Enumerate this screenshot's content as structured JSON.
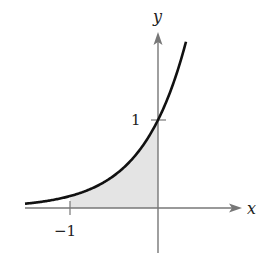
{
  "chart_data": {
    "type": "area",
    "title": "",
    "function": "y = e^(2x)",
    "xlabel": "x",
    "ylabel": "y",
    "x_ticks": [
      {
        "value": -1,
        "label": "−1"
      }
    ],
    "y_ticks": [
      {
        "value": 1,
        "label": "1"
      }
    ],
    "xlim": [
      -1.51,
      0.93
    ],
    "ylim": [
      -0.51,
      2.0
    ],
    "shaded_region": {
      "from_x": -1,
      "to_x": 0,
      "description": "area under curve between x=-1 and x=0"
    },
    "points": [
      {
        "x": -1.5,
        "y": 0.05
      },
      {
        "x": -1.0,
        "y": 0.135
      },
      {
        "x": -0.5,
        "y": 0.368
      },
      {
        "x": 0.0,
        "y": 1.0
      },
      {
        "x": 0.3,
        "y": 1.82
      }
    ],
    "grid": false,
    "colors": {
      "curve": "#111111",
      "axes": "#777777",
      "shade": "#e4e4e4"
    }
  },
  "labels": {
    "x_axis": "x",
    "y_axis": "y",
    "x_tick_neg1": "−1",
    "y_tick_1": "1"
  }
}
